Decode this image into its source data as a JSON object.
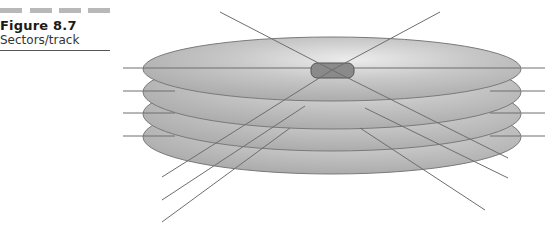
{
  "caption": {
    "figure_number": "Figure 8.7",
    "title": "Sectors/track"
  },
  "diagram": {
    "platter_count": 4,
    "colors": {
      "platter_fill": "#b4b4b4",
      "platter_highlight": "#e6e6e6",
      "platter_edge": "#7a7a7a",
      "line": "#6e6e6e",
      "spindle": "#8a8a8a",
      "caption_bars": "#b8b8b8"
    }
  },
  "footer": {
    "partial_text": ""
  }
}
